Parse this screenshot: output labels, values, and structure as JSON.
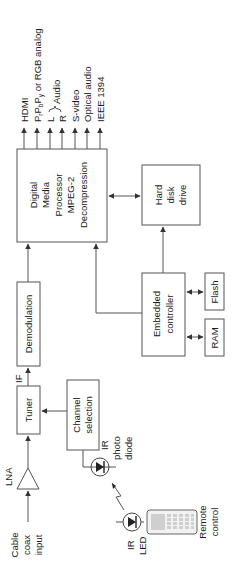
{
  "diagram": {
    "orientation": "rotated-90-ccw",
    "colors": {
      "line": "#555555",
      "text": "#1a1a1a",
      "background": "#ffffff",
      "remote_key": "#cfcfcf"
    },
    "blocks": {
      "dmp": {
        "lines": [
          "Digital",
          "Media",
          "Processor",
          "MPEG-2",
          "Decompression"
        ]
      },
      "hdd": {
        "lines": [
          "Hard",
          "disk",
          "drive"
        ]
      },
      "demod": {
        "label": "Demodulation"
      },
      "tuner": {
        "label": "Tuner"
      },
      "chsel": {
        "lines": [
          "Channel",
          "selection"
        ]
      },
      "embedded": {
        "lines": [
          "Embedded",
          "controller"
        ]
      },
      "flash": {
        "label": "Flash"
      },
      "ram": {
        "label": "RAM"
      }
    },
    "signals": {
      "if_label": "IF",
      "lna_label": "LNA",
      "cable_input": [
        "Cable",
        "coax",
        "input"
      ],
      "photodiode": [
        "IR",
        "photo",
        "diode"
      ],
      "ir_led": [
        "IR",
        "LED"
      ],
      "remote": [
        "Remote",
        "control"
      ]
    },
    "outputs": [
      {
        "label": "HDMI"
      },
      {
        "label": "PrPbPy or RGB analog",
        "main": "P",
        "sub1": "r",
        "p2": "P",
        "sub2": "b",
        "p3": "P",
        "sub3": "y",
        "tail": " or RGB analog"
      },
      {
        "label": "L"
      },
      {
        "label": "R"
      },
      {
        "label": "S-video"
      },
      {
        "label": "Optical audio"
      },
      {
        "label": "IEEE 1394"
      }
    ],
    "audio_brace_label": "Audio"
  }
}
